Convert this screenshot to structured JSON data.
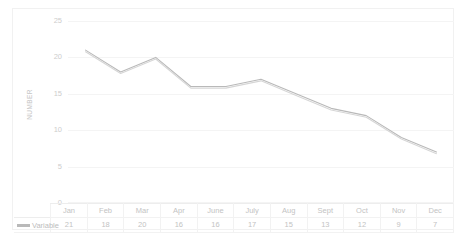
{
  "chart_data": {
    "type": "line",
    "title": "",
    "xlabel": "",
    "ylabel": "NUMBER",
    "categories": [
      "Jan",
      "Feb",
      "Mar",
      "Apr",
      "June",
      "July",
      "Aug",
      "Sept",
      "Oct",
      "Nov",
      "Dec"
    ],
    "series": [
      {
        "name": "Variable",
        "values": [
          21,
          18,
          20,
          16,
          16,
          17,
          15,
          13,
          12,
          9,
          7
        ],
        "color": "#b9b9b9"
      }
    ],
    "ylim": [
      0,
      25
    ],
    "yticks": [
      0,
      5,
      10,
      15,
      20,
      25
    ],
    "ytick_labels": [
      "0",
      "5",
      "10",
      "15",
      "20",
      "25"
    ],
    "grid": true,
    "legend_position": "bottom-left-table",
    "has_data_table": true
  },
  "table": {
    "legend_label": "Variable",
    "headers": [
      "Jan",
      "Feb",
      "Mar",
      "Apr",
      "June",
      "July",
      "Aug",
      "Sept",
      "Oct",
      "Nov",
      "Dec"
    ],
    "values": [
      "21",
      "18",
      "20",
      "16",
      "16",
      "17",
      "15",
      "13",
      "12",
      "9",
      "7"
    ]
  },
  "axis": {
    "y_title": "NUMBER",
    "y_labels": [
      "25",
      "20",
      "15",
      "10",
      "5",
      "0"
    ]
  },
  "colors": {
    "series": "#b9b9b9",
    "gridline": "#f4f4f4",
    "text": "#c3c3c3",
    "frame": "#f1f1f1"
  }
}
